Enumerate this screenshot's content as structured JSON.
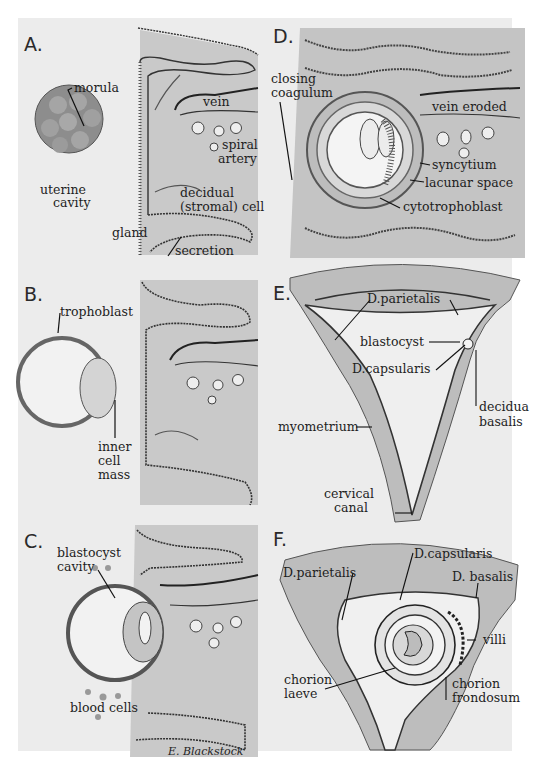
{
  "figure": {
    "signature": "E. Blackstock",
    "palette": {
      "background": "#ffffff",
      "plate": "#ececec",
      "tissue": "#c8c8c8",
      "tissue_dark": "#a9a9a9",
      "ink": "#1e1e1e"
    }
  },
  "panels": {
    "A": {
      "letter": "A.",
      "labels": {
        "morula": "morula",
        "uterine_cavity_1": "uterine",
        "uterine_cavity_2": "cavity",
        "vein": "vein",
        "spiral_1": "spiral",
        "spiral_2": "artery",
        "decidual_1": "decidual",
        "decidual_2": "(stromal) cell",
        "gland": "gland",
        "secretion": "secretion"
      }
    },
    "B": {
      "letter": "B.",
      "labels": {
        "trophoblast": "trophoblast",
        "icm_1": "inner",
        "icm_2": "cell",
        "icm_3": "mass"
      }
    },
    "C": {
      "letter": "C.",
      "labels": {
        "cavity_1": "blastocyst",
        "cavity_2": "cavity",
        "blood_cells": "blood cells"
      }
    },
    "D": {
      "letter": "D.",
      "labels": {
        "closing_1": "closing",
        "closing_2": "coagulum",
        "vein_eroded": "vein eroded",
        "syncytium": "syncytium",
        "lacunar": "lacunar space",
        "cytotrophoblast": "cytotrophoblast"
      }
    },
    "E": {
      "letter": "E.",
      "labels": {
        "parietalis": "D.parietalis",
        "blastocyst": "blastocyst",
        "capsularis": "D.capsularis",
        "decidua_1": "decidua",
        "decidua_2": "basalis",
        "myometrium": "myometrium",
        "cervical_1": "cervical",
        "cervical_2": "canal"
      }
    },
    "F": {
      "letter": "F.",
      "labels": {
        "capsularis": "D.capsularis",
        "parietalis": "D.parietalis",
        "basalis": "D. basalis",
        "villi": "villi",
        "laeve_1": "chorion",
        "laeve_2": "laeve",
        "frondosum_1": "chorion",
        "frondosum_2": "frondosum"
      }
    }
  }
}
